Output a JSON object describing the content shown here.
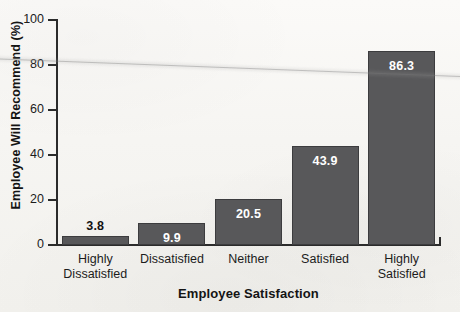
{
  "chart_data": {
    "type": "bar",
    "title": "",
    "xlabel": "Employee Satisfaction",
    "ylabel": "Employee Will Recommend (%)",
    "categories": [
      "Highly Dissatisfied",
      "Dissatisfied",
      "Neither",
      "Satisfied",
      "Highly Satisfied"
    ],
    "category_lines": [
      [
        "Highly",
        "Dissatisfied"
      ],
      [
        "Dissatisfied",
        ""
      ],
      [
        "Neither",
        ""
      ],
      [
        "Satisfied",
        ""
      ],
      [
        "Highly",
        "Satisfied"
      ]
    ],
    "values": [
      3.8,
      9.9,
      20.5,
      43.9,
      86.3
    ],
    "value_labels": [
      "3.8",
      "9.9",
      "20.5",
      "43.9",
      "86.3"
    ],
    "label_placement": [
      "above",
      "inside",
      "inside",
      "inside",
      "inside"
    ],
    "ylim": [
      0,
      100
    ],
    "yticks": [
      0,
      20,
      40,
      60,
      80,
      100
    ],
    "ytick_labels": [
      "0",
      "20",
      "40",
      "60",
      "80",
      "100"
    ],
    "grid": false,
    "legend": null,
    "bar_color": "#58585a",
    "bar_edge_color": "#3c3c3e",
    "axis_color": "#2b2b2b",
    "background_color": "#f7f6f3"
  },
  "annotations": {
    "scan_artifact": "faint diagonal crease line across upper plot area"
  }
}
